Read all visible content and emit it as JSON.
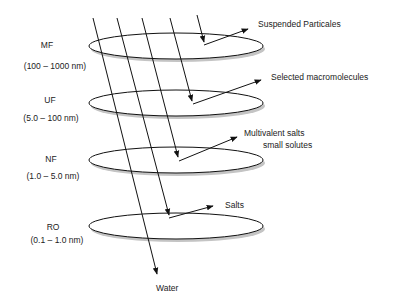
{
  "diagram": {
    "type": "membrane-filtration-spectrum",
    "stages": [
      {
        "name": "MF",
        "range": "(100 – 1000 nm)",
        "retained": "Suspended Particales"
      },
      {
        "name": "UF",
        "range": "(5.0 – 100 nm)",
        "retained": "Selected macromolecules"
      },
      {
        "name": "NF",
        "range": "(1.0 – 5.0 nm)",
        "retained": "Multivalent salts",
        "retained_line2": "small solutes"
      },
      {
        "name": "RO",
        "range": "(0.1 – 1.0 nm)",
        "retained": "Salts"
      }
    ],
    "permeate": "Water",
    "colors": {
      "line": "#111111",
      "shadow": "#b8b8b8",
      "text": "#222222"
    }
  }
}
